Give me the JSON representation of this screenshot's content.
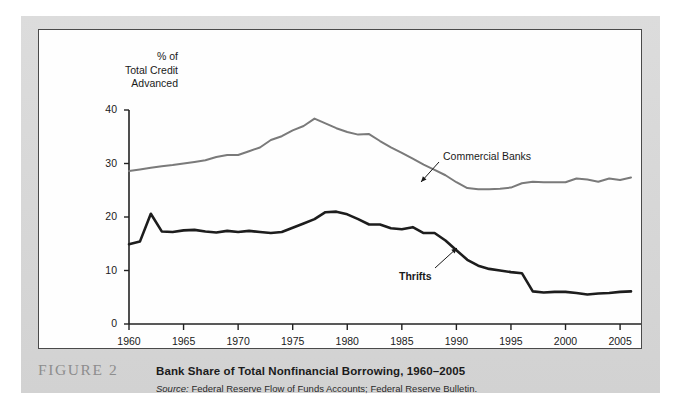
{
  "figure": {
    "tag": "FIGURE 2",
    "title": "Bank Share of Total Nonfinancial Borrowing, 1960–2005",
    "source_prefix": "Source:",
    "source_text": " Federal Reserve Flow of Funds Accounts; Federal Reserve Bulletin."
  },
  "axis_title_lines": {
    "line1": "% of",
    "line2": "Total Credit",
    "line3": "Advanced"
  },
  "annotations": {
    "commercial_banks": "Commercial Banks",
    "thrifts": "Thrifts"
  },
  "colors": {
    "commercial_banks_line": "#7a7a7a",
    "thrifts_line": "#1d1d1d",
    "axis": "#222222",
    "panel_background": "#d8d8d8",
    "chart_background": "#fefefe",
    "figure_tag": "#8d8d8d"
  },
  "chart_data": {
    "type": "line",
    "title": "Bank Share of Total Nonfinancial Borrowing, 1960–2005",
    "xlabel": "",
    "ylabel": "% of Total Credit Advanced",
    "xlim": [
      1960,
      2006
    ],
    "ylim": [
      0,
      40
    ],
    "yticks": [
      0,
      10,
      20,
      30,
      40
    ],
    "xticks": [
      1960,
      1965,
      1970,
      1975,
      1980,
      1985,
      1990,
      1995,
      2000,
      2005
    ],
    "grid": false,
    "legend": "inline-annotations",
    "x": [
      1960,
      1961,
      1962,
      1963,
      1964,
      1965,
      1966,
      1967,
      1968,
      1969,
      1970,
      1971,
      1972,
      1973,
      1974,
      1975,
      1976,
      1977,
      1978,
      1979,
      1980,
      1981,
      1982,
      1983,
      1984,
      1985,
      1986,
      1987,
      1988,
      1989,
      1990,
      1991,
      1992,
      1993,
      1994,
      1995,
      1996,
      1997,
      1998,
      1999,
      2000,
      2001,
      2002,
      2003,
      2004,
      2005,
      2006
    ],
    "series": [
      {
        "name": "Commercial Banks",
        "color": "#7a7a7a",
        "width": 2.0,
        "values": [
          28.6,
          28.9,
          29.2,
          29.5,
          29.7,
          30.0,
          30.3,
          30.6,
          31.2,
          31.6,
          31.6,
          32.3,
          33.0,
          34.4,
          35.1,
          36.2,
          37.0,
          38.4,
          37.5,
          36.6,
          35.9,
          35.4,
          35.5,
          34.2,
          33.0,
          32.0,
          30.9,
          29.8,
          28.8,
          27.8,
          26.5,
          25.4,
          25.2,
          25.2,
          25.3,
          25.5,
          26.3,
          26.6,
          26.5,
          26.5,
          26.5,
          27.2,
          27.0,
          26.6,
          27.2,
          26.9,
          27.4
        ]
      },
      {
        "name": "Thrifts",
        "color": "#1d1d1d",
        "width": 2.6,
        "values": [
          14.9,
          15.4,
          20.6,
          17.3,
          17.2,
          17.5,
          17.6,
          17.3,
          17.1,
          17.4,
          17.2,
          17.4,
          17.2,
          17.0,
          17.2,
          18.0,
          18.8,
          19.6,
          20.9,
          21.0,
          20.5,
          19.6,
          18.6,
          18.6,
          17.9,
          17.7,
          18.1,
          17.0,
          17.0,
          15.6,
          13.8,
          12.0,
          10.9,
          10.3,
          10.0,
          9.7,
          9.5,
          6.1,
          5.9,
          6.0,
          6.0,
          5.8,
          5.5,
          5.7,
          5.8,
          6.0,
          6.1
        ]
      }
    ]
  }
}
